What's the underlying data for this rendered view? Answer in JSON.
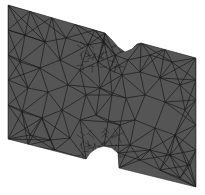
{
  "figure": {
    "background": "#ffffff",
    "fill_color": "#555555",
    "mesh_line_color": "#1a1a1a",
    "outline": [
      [
        8,
        5
      ],
      [
        105,
        33
      ],
      [
        112,
        40
      ],
      [
        118,
        47
      ],
      [
        125,
        52
      ],
      [
        132,
        49
      ],
      [
        137,
        44
      ],
      [
        141,
        43
      ],
      [
        196,
        58
      ],
      [
        196,
        187
      ],
      [
        119,
        168
      ],
      [
        118,
        153
      ],
      [
        112,
        148
      ],
      [
        104,
        146
      ],
      [
        97,
        148
      ],
      [
        90,
        153
      ],
      [
        86,
        159
      ],
      [
        8,
        139
      ]
    ],
    "nodes": [
      [
        8,
        5
      ],
      [
        30,
        11
      ],
      [
        52,
        17
      ],
      [
        75,
        24
      ],
      [
        95,
        30
      ],
      [
        105,
        33
      ],
      [
        141,
        43
      ],
      [
        165,
        49
      ],
      [
        196,
        58
      ],
      [
        8,
        30
      ],
      [
        25,
        35
      ],
      [
        45,
        42
      ],
      [
        66,
        38
      ],
      [
        88,
        45
      ],
      [
        104,
        42
      ],
      [
        115,
        55
      ],
      [
        128,
        60
      ],
      [
        150,
        55
      ],
      [
        172,
        62
      ],
      [
        196,
        80
      ],
      [
        8,
        55
      ],
      [
        20,
        62
      ],
      [
        40,
        68
      ],
      [
        60,
        60
      ],
      [
        80,
        70
      ],
      [
        98,
        62
      ],
      [
        110,
        70
      ],
      [
        122,
        75
      ],
      [
        140,
        72
      ],
      [
        160,
        78
      ],
      [
        180,
        85
      ],
      [
        196,
        100
      ],
      [
        8,
        80
      ],
      [
        28,
        88
      ],
      [
        48,
        92
      ],
      [
        68,
        85
      ],
      [
        86,
        95
      ],
      [
        100,
        88
      ],
      [
        112,
        95
      ],
      [
        126,
        98
      ],
      [
        145,
        95
      ],
      [
        165,
        102
      ],
      [
        185,
        110
      ],
      [
        196,
        125
      ],
      [
        8,
        105
      ],
      [
        22,
        112
      ],
      [
        42,
        118
      ],
      [
        62,
        110
      ],
      [
        80,
        120
      ],
      [
        96,
        115
      ],
      [
        108,
        122
      ],
      [
        120,
        125
      ],
      [
        135,
        120
      ],
      [
        155,
        128
      ],
      [
        175,
        135
      ],
      [
        196,
        150
      ],
      [
        8,
        139
      ],
      [
        30,
        135
      ],
      [
        50,
        140
      ],
      [
        70,
        138
      ],
      [
        86,
        159
      ],
      [
        104,
        146
      ],
      [
        118,
        153
      ],
      [
        119,
        168
      ],
      [
        140,
        160
      ],
      [
        160,
        170
      ],
      [
        180,
        178
      ],
      [
        196,
        187
      ],
      [
        28,
        145
      ],
      [
        55,
        150
      ],
      [
        130,
        145
      ],
      [
        150,
        150
      ],
      [
        170,
        155
      ],
      [
        190,
        165
      ]
    ]
  }
}
